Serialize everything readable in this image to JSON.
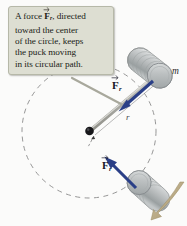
{
  "figure": {
    "type": "physics-diagram",
    "background_color": "#fbfbfa"
  },
  "callout": {
    "name": "explanatory-callout",
    "background_color": "#ddded2",
    "border_color": "#b6b8a8",
    "lines": [
      {
        "pre": "A force ",
        "vector": "F",
        "subscript": "r",
        "post": ", directed"
      },
      {
        "pre": "toward the center",
        "vector": "",
        "subscript": "",
        "post": ""
      },
      {
        "pre": "of the circle, keeps",
        "vector": "",
        "subscript": "",
        "post": ""
      },
      {
        "pre": "the puck moving",
        "vector": "",
        "subscript": "",
        "post": ""
      },
      {
        "pre": "in its circular path.",
        "vector": "",
        "subscript": "",
        "post": ""
      }
    ],
    "full_text": "A force F_r , directed toward the center of the circle, keeps the puck moving in its circular path."
  },
  "labels": {
    "force_top": {
      "symbol": "F",
      "subscript": "r",
      "color": "#141423"
    },
    "force_bottom": {
      "symbol": "F",
      "subscript": "r",
      "color": "#141423"
    },
    "mass": "m",
    "radius": "r"
  },
  "geometry": {
    "center": {
      "x": 89,
      "y": 131
    },
    "circle_radius": 67,
    "circle_style": "dashed",
    "circle_color": "#8a8a8a",
    "puck_top": {
      "x": 156,
      "y": 73
    },
    "puck_bottom": {
      "x": 152,
      "y": 196
    },
    "force_arrow_color": "#2a3f87",
    "string_color": "#b9b9b4",
    "motion_arrow_color": "#b9a987"
  },
  "colors": {
    "force_vector": "#2a3f87",
    "puck_body": "#b9bcbd",
    "puck_highlight": "#e4e6e6",
    "puck_edge": "#8e9293",
    "dashed_line": "#8a8a8a",
    "callout_bg": "#ddded2",
    "leader_line": "#a8a89c",
    "motion_arrow": "#b9a987",
    "center_dot": "#17171a"
  }
}
